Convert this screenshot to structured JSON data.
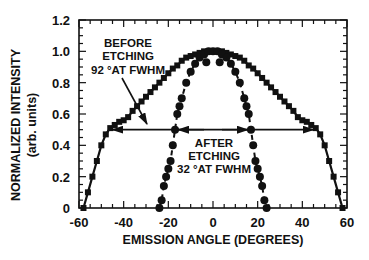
{
  "chart_data": {
    "type": "line",
    "title": "",
    "xlabel": "EMISSION ANGLE (DEGREES)",
    "ylabel": "NORMALIZED INTENSITY",
    "ylabel_sub": "(arb. units)",
    "xlim": [
      -60,
      60
    ],
    "ylim": [
      0,
      1.2
    ],
    "xticks": [
      -60,
      -40,
      -20,
      0,
      20,
      40,
      60
    ],
    "xtick_labels": [
      "-60",
      "-40",
      "-20",
      "0",
      "20",
      "40",
      "60"
    ],
    "yticks": [
      0,
      0.2,
      0.4,
      0.6,
      0.8,
      1.0,
      1.2
    ],
    "ytick_labels": [
      "0",
      "0.2",
      "0.4",
      "0.6",
      "0.8",
      "1.0",
      "1.2"
    ],
    "grid": false,
    "legend": null,
    "series": [
      {
        "name": "Before etching",
        "marker": "square",
        "line": "solid",
        "x": [
          -58,
          -56,
          -54,
          -52,
          -50,
          -48,
          -46,
          -44,
          -42,
          -40,
          -38,
          -36,
          -34,
          -32,
          -30,
          -28,
          -26,
          -24,
          -22,
          -20,
          -18,
          -16,
          -14,
          -12,
          -10,
          -8,
          -6,
          -4,
          -2,
          0,
          2,
          4,
          6,
          8,
          10,
          12,
          14,
          16,
          18,
          20,
          22,
          24,
          26,
          28,
          30,
          32,
          34,
          36,
          38,
          40,
          42,
          44,
          46,
          48,
          50,
          52,
          54,
          56,
          58
        ],
        "y": [
          0.0,
          0.1,
          0.2,
          0.3,
          0.4,
          0.47,
          0.51,
          0.53,
          0.55,
          0.56,
          0.58,
          0.62,
          0.65,
          0.68,
          0.71,
          0.74,
          0.77,
          0.8,
          0.83,
          0.86,
          0.89,
          0.91,
          0.94,
          0.96,
          0.97,
          0.98,
          0.99,
          1.0,
          1.0,
          1.0,
          1.0,
          1.0,
          0.99,
          0.98,
          0.97,
          0.96,
          0.94,
          0.91,
          0.89,
          0.86,
          0.83,
          0.8,
          0.77,
          0.74,
          0.71,
          0.68,
          0.65,
          0.62,
          0.58,
          0.56,
          0.55,
          0.53,
          0.51,
          0.47,
          0.4,
          0.3,
          0.2,
          0.1,
          0.0
        ]
      },
      {
        "name": "After etching",
        "marker": "circle",
        "line": "dashed",
        "x": [
          -24,
          -23,
          -22,
          -21,
          -20,
          -19,
          -18,
          -17,
          -16,
          -15,
          -14,
          -12,
          -10,
          -8,
          -6,
          -4,
          -2,
          0,
          2,
          4,
          6,
          8,
          10,
          12,
          14,
          15,
          16,
          17,
          18,
          19,
          20,
          21,
          22,
          23,
          24
        ],
        "y": [
          0.0,
          0.05,
          0.14,
          0.2,
          0.25,
          0.3,
          0.4,
          0.5,
          0.6,
          0.65,
          0.7,
          0.8,
          0.87,
          0.92,
          0.96,
          0.98,
          1.0,
          1.0,
          1.0,
          0.98,
          0.96,
          0.92,
          0.87,
          0.8,
          0.7,
          0.65,
          0.6,
          0.5,
          0.4,
          0.3,
          0.25,
          0.2,
          0.14,
          0.05,
          0.0
        ]
      },
      {
        "name": "After etching (inner dots)",
        "marker": "circle",
        "line": "none",
        "x": [
          -3,
          3
        ],
        "y": [
          0.93,
          0.93
        ]
      }
    ],
    "annotations": [
      {
        "text": [
          "BEFORE",
          "ETCHING",
          "92 °AT FWHM"
        ],
        "points_to": [
          -30,
          0.5
        ]
      },
      {
        "text": [
          "AFTER",
          "ETCHING",
          "32 °AT FWHM"
        ],
        "points_to": [
          0,
          0.5
        ]
      },
      {
        "type": "double-arrow",
        "x_from": -46,
        "x_to": 46,
        "y": 0.5,
        "label": "92° FWHM"
      },
      {
        "type": "double-arrow",
        "x_from": -17,
        "x_to": 17,
        "y": 0.5,
        "label": "32° FWHM"
      }
    ]
  },
  "labels": {
    "ylabel": "NORMALIZED INTENSITY",
    "ylabel_sub": "(arb. units)",
    "xlabel": "EMISSION ANGLE (DEGREES)",
    "before": [
      "BEFORE",
      "ETCHING",
      "92 °AT FWHM"
    ],
    "after": [
      "AFTER",
      "ETCHING",
      "32 °AT FWHM"
    ]
  }
}
